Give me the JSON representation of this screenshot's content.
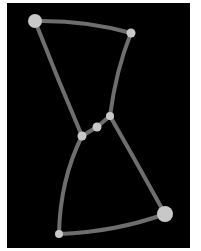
{
  "diagram": {
    "type": "node-link graph",
    "background": "#000000",
    "edge_color": "#6e6e6e",
    "node_color": "#c8c8c8",
    "nodes": [
      {
        "id": "A",
        "x": 35,
        "y": 21,
        "r": 7
      },
      {
        "id": "B",
        "x": 131,
        "y": 33,
        "r": 4.5
      },
      {
        "id": "C",
        "x": 110,
        "y": 116,
        "r": 4
      },
      {
        "id": "D",
        "x": 97,
        "y": 127,
        "r": 4.5
      },
      {
        "id": "E",
        "x": 82,
        "y": 136,
        "r": 4.5
      },
      {
        "id": "F",
        "x": 165,
        "y": 214,
        "r": 8
      },
      {
        "id": "G",
        "x": 59,
        "y": 234,
        "r": 4
      }
    ],
    "edges": [
      {
        "from": "A",
        "to": "B"
      },
      {
        "from": "B",
        "to": "C"
      },
      {
        "from": "A",
        "to": "E"
      },
      {
        "from": "C",
        "to": "D"
      },
      {
        "from": "D",
        "to": "E"
      },
      {
        "from": "C",
        "to": "F"
      },
      {
        "from": "E",
        "to": "G"
      },
      {
        "from": "G",
        "to": "F"
      }
    ]
  }
}
